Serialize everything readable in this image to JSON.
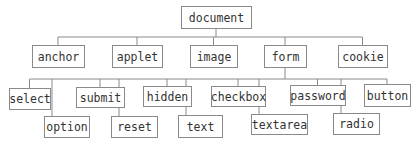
{
  "diagram": {
    "type": "tree",
    "root": "document",
    "nodes": [
      {
        "id": "document",
        "label": "document",
        "parent": null
      },
      {
        "id": "anchor",
        "label": "anchor",
        "parent": "document"
      },
      {
        "id": "applet",
        "label": "applet",
        "parent": "document"
      },
      {
        "id": "image",
        "label": "image",
        "parent": "document"
      },
      {
        "id": "form",
        "label": "form",
        "parent": "document"
      },
      {
        "id": "cookie",
        "label": "cookie",
        "parent": "document"
      },
      {
        "id": "select",
        "label": "select",
        "parent": "form"
      },
      {
        "id": "option",
        "label": "option",
        "parent": "form"
      },
      {
        "id": "submit",
        "label": "submit",
        "parent": "form"
      },
      {
        "id": "reset",
        "label": "reset",
        "parent": "form"
      },
      {
        "id": "hidden",
        "label": "hidden",
        "parent": "form"
      },
      {
        "id": "text",
        "label": "text",
        "parent": "form"
      },
      {
        "id": "checkbox",
        "label": "checkbox",
        "parent": "form"
      },
      {
        "id": "textarea",
        "label": "textarea",
        "parent": "form"
      },
      {
        "id": "password",
        "label": "password",
        "parent": "form"
      },
      {
        "id": "radio",
        "label": "radio",
        "parent": "form"
      },
      {
        "id": "button",
        "label": "button",
        "parent": "form"
      }
    ]
  }
}
